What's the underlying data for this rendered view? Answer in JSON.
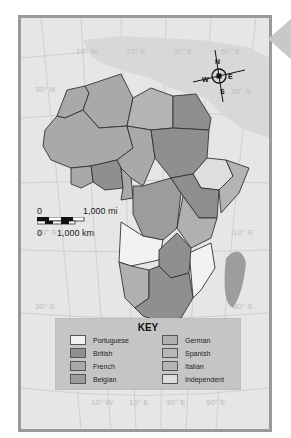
{
  "map": {
    "subject": "Colonial Africa",
    "grid_labels": {
      "top": [
        "10° W",
        "10° E",
        "30° E",
        "50° E"
      ],
      "bottom": [
        "10° W",
        "10° E",
        "30° E",
        "50° E"
      ],
      "left": [
        "30° N",
        "10° S",
        "30° S"
      ],
      "right": [
        "30° N",
        "10° S",
        "30° S"
      ]
    },
    "compass": {
      "N": "N",
      "S": "S",
      "E": "E",
      "W": "W"
    },
    "scale": {
      "mi_zero": "0",
      "mi_label": "1,000 mi",
      "km_zero": "0",
      "km_label": "1,000 km"
    },
    "colors": {
      "ocean": "#e6e6e6",
      "land_other": "#d8d8d8",
      "frame": "#9a9a9a",
      "portuguese": "#f2f2f2",
      "british": "#8f8f8f",
      "french": "#a9a9a9",
      "belgian": "#9c9c9c",
      "german": "#b0b0b0",
      "spanish": "#b8b8b8",
      "italian": "#b4b4b4",
      "independent": "#dedede"
    }
  },
  "key": {
    "title": "KEY",
    "items": [
      {
        "label": "Portuguese",
        "color": "#f2f2f2"
      },
      {
        "label": "British",
        "color": "#8f8f8f"
      },
      {
        "label": "French",
        "color": "#a9a9a9"
      },
      {
        "label": "Belgian",
        "color": "#9c9c9c"
      },
      {
        "label": "German",
        "color": "#b0b0b0"
      },
      {
        "label": "Spanish",
        "color": "#b8b8b8"
      },
      {
        "label": "Italian",
        "color": "#b4b4b4"
      },
      {
        "label": "Independent",
        "color": "#dedede"
      }
    ]
  }
}
